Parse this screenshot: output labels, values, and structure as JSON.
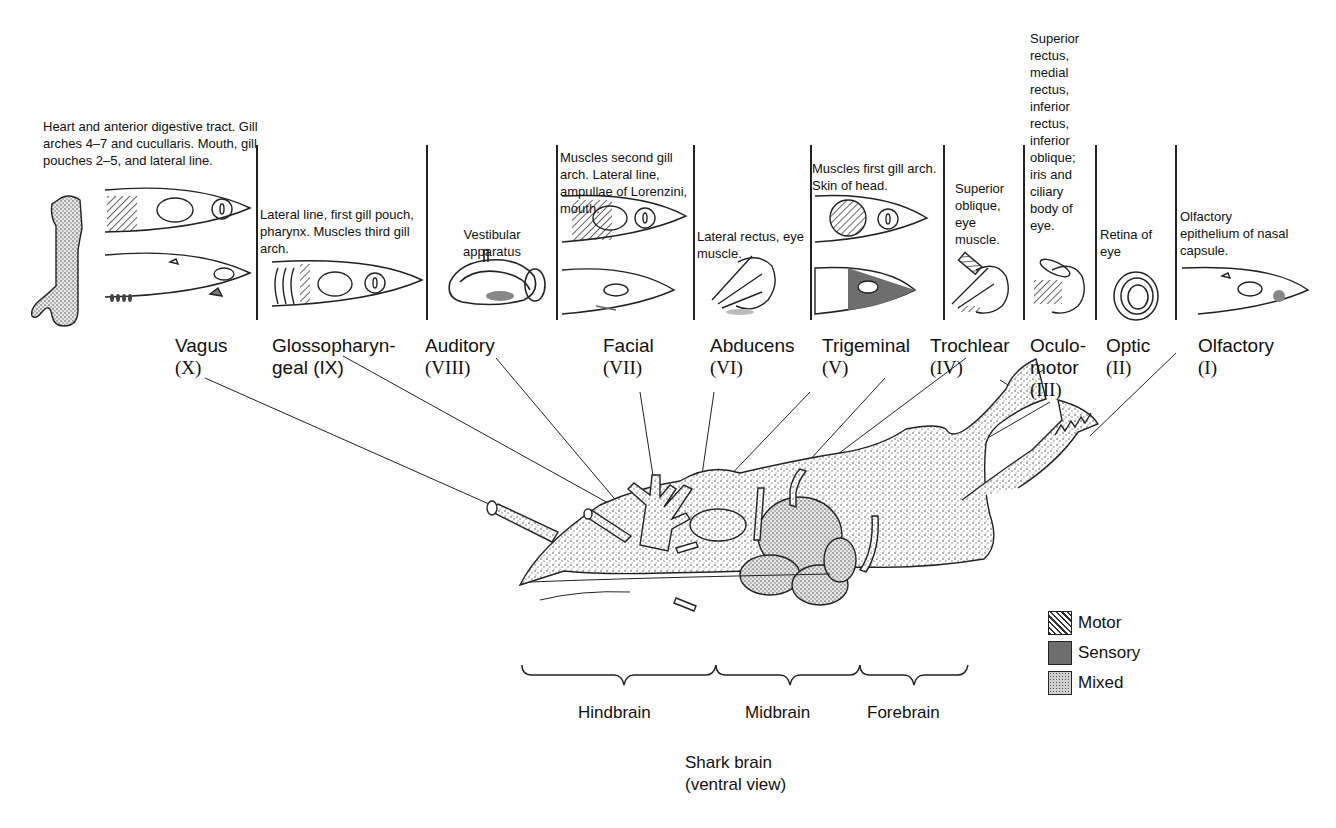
{
  "figure": {
    "title": "Shark brain",
    "subtitle": "(ventral view)"
  },
  "nerves": [
    {
      "id": "vagus",
      "name": "Vagus",
      "numeral": "(X)",
      "function": "Heart and anterior digestive tract. Gill arches 4–7 and cucullaris. Mouth, gill pouches 2–5, and lateral line.",
      "type": "Mixed"
    },
    {
      "id": "glossopharyngeal",
      "name": "Glossopharyn-",
      "name_line2": "geal (IX)",
      "numeral": "",
      "function": "Lateral line, first gill pouch, pharynx. Muscles third gill arch.",
      "type": "Mixed"
    },
    {
      "id": "auditory",
      "name": "Auditory",
      "numeral": "(VIII)",
      "function": "Vestibular apparatus",
      "type": "Sensory"
    },
    {
      "id": "facial",
      "name": "Facial",
      "numeral": "(VII)",
      "function": "Muscles second gill arch. Lateral line, ampullae of Lorenzini, mouth.",
      "type": "Mixed"
    },
    {
      "id": "abducens",
      "name": "Abducens",
      "numeral": "(VI)",
      "function": "Lateral rectus, eye muscle.",
      "type": "Motor"
    },
    {
      "id": "trigeminal",
      "name": "Trigeminal",
      "numeral": "(V)",
      "function": "Muscles first gill arch. Skin of head.",
      "type": "Mixed"
    },
    {
      "id": "trochlear",
      "name": "Trochlear",
      "numeral": "(IV)",
      "function": "Superior oblique, eye muscle.",
      "type": "Motor"
    },
    {
      "id": "oculomotor",
      "name": "Oculo-",
      "name_line2": "motor",
      "numeral": "(III)",
      "function": "Superior rectus, medial rectus, inferior rectus, inferior oblique; iris and ciliary body of eye.",
      "type": "Motor"
    },
    {
      "id": "optic",
      "name": "Optic",
      "numeral": "(II)",
      "function": "Retina of eye",
      "type": "Sensory"
    },
    {
      "id": "olfactory",
      "name": "Olfactory",
      "numeral": "(I)",
      "function": "Olfactory epithelium of nasal capsule.",
      "type": "Sensory"
    }
  ],
  "regions": [
    {
      "label": "Hindbrain"
    },
    {
      "label": "Midbrain"
    },
    {
      "label": "Forebrain"
    }
  ],
  "legend": [
    {
      "label": "Motor",
      "pattern": "hatched"
    },
    {
      "label": "Sensory",
      "pattern": "solid-gray"
    },
    {
      "label": "Mixed",
      "pattern": "stippled"
    }
  ],
  "colors": {
    "ink": "#111111",
    "sensory_fill": "#6e6e6e",
    "mixed_fill": "#bdbdbd",
    "background": "#ffffff"
  }
}
